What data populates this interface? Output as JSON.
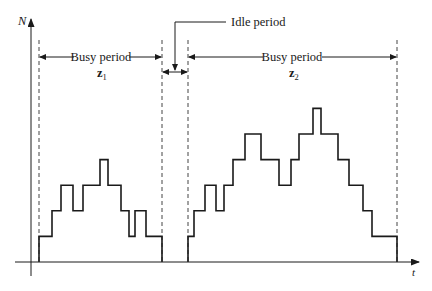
{
  "axes": {
    "y_label": "N",
    "x_label": "t"
  },
  "labels": {
    "busy1_text": "Busy period",
    "busy1_symbol": "z",
    "busy1_subscript": "1",
    "idle_text": "Idle period",
    "busy2_text": "Busy period",
    "busy2_symbol": "z",
    "busy2_subscript": "2"
  },
  "colors": {
    "line": "#1a1a1a",
    "dashed": "#444444",
    "background": "#ffffff"
  },
  "chart_data": {
    "type": "line",
    "title": "",
    "xlabel": "t",
    "ylabel": "N",
    "series": [
      {
        "name": "Busy period z1",
        "steps_x_px": [
          39,
          52,
          61,
          73,
          83,
          100,
          108,
          121,
          129,
          135,
          146,
          162
        ],
        "levels": [
          1,
          2,
          3,
          2,
          3,
          4,
          3,
          2,
          1,
          2,
          1,
          0
        ]
      },
      {
        "name": "Idle period",
        "steps_x_px": [
          162,
          188
        ],
        "levels": [
          0,
          0
        ]
      },
      {
        "name": "Busy period z2",
        "steps_x_px": [
          188,
          194,
          205,
          216,
          224,
          233,
          245,
          261,
          279,
          291,
          299,
          313,
          321,
          338,
          349,
          363,
          372,
          397
        ],
        "levels": [
          1,
          2,
          3,
          2,
          3,
          4,
          5,
          4,
          3,
          4,
          5,
          6,
          5,
          4,
          3,
          2,
          1,
          0
        ]
      }
    ],
    "annotations": [
      "Busy period z1",
      "Idle period",
      "Busy period z2"
    ],
    "grid": false
  }
}
